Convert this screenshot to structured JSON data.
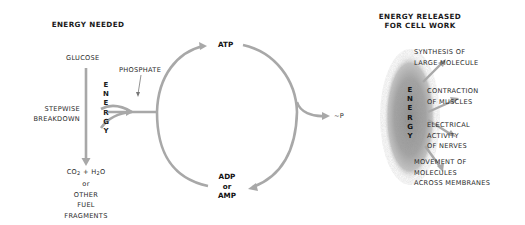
{
  "headers": {
    "energy_needed": "ENERGY NEEDED",
    "energy_released_line1": "ENERGY RELEASED",
    "energy_released_line2": "FOR CELL WORK"
  },
  "left": {
    "glucose": "GLUCOSE",
    "stepwise_line1": "STEPWISE",
    "stepwise_line2": "BREAKDOWN",
    "products_line1_a": "CO",
    "products_line1_sub1": "2",
    "products_line1_b": " + H",
    "products_line1_sub2": "2",
    "products_line1_c": "O",
    "products_line2": "or",
    "products_line3": "OTHER",
    "products_line4": "FUEL",
    "products_line5": "FRAGMENTS",
    "phosphate": "PHOSPHATE",
    "energy_vertical": [
      "E",
      "N",
      "E",
      "R",
      "G",
      "Y"
    ]
  },
  "cycle": {
    "atp": "ATP",
    "adp_line1": "ADP",
    "adp_line2": "or",
    "adp_line3": "AMP",
    "tilde_p": "~P"
  },
  "right": {
    "energy_vertical": [
      "E",
      "N",
      "E",
      "R",
      "G",
      "Y"
    ],
    "outputs": [
      {
        "line1": "SYNTHESIS OF",
        "line2": "LARGE MOLECULE"
      },
      {
        "line1": "CONTRACTION",
        "line2": "OF MUSCLES"
      },
      {
        "line1": "ELECTRICAL",
        "line2": "ACTIVITY",
        "line3": "OF NERVES"
      },
      {
        "line1": "MOVEMENT OF",
        "line2": "MOLECULES",
        "line3": "ACROSS MEMBRANES"
      }
    ]
  },
  "colors": {
    "arrow": "#a8a8a8",
    "text": "#1a1a1a",
    "energy_cloud": "#9a9a9a"
  }
}
